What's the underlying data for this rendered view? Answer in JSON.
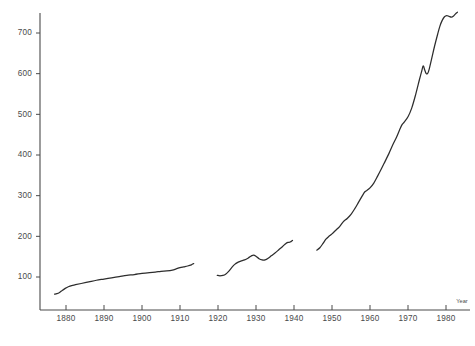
{
  "chart_data": {
    "type": "line",
    "title": "",
    "subtitle": "",
    "xlabel": "Year",
    "ylabel": "",
    "grid": false,
    "legend": "none",
    "xlim": [
      1872,
      1986
    ],
    "ylim": [
      0,
      775
    ],
    "x_ticks": [
      1880,
      1890,
      1900,
      1910,
      1920,
      1930,
      1940,
      1950,
      1960,
      1970,
      1980
    ],
    "x_tick_labels": [
      "1880",
      "1890",
      "1900",
      "1910",
      "1920",
      "1930",
      "1940",
      "1950",
      "1960",
      "1970",
      "1980"
    ],
    "y_ticks": [
      100,
      200,
      300,
      400,
      500,
      600,
      700
    ],
    "y_tick_labels": [
      "100",
      "200",
      "300",
      "400",
      "500",
      "600",
      "700"
    ],
    "line_color": "#2d2d2d",
    "axis_color": "#4a4a4a",
    "series": [
      {
        "name": "segment-1",
        "points": [
          [
            1877.0,
            58
          ],
          [
            1877.6,
            59
          ],
          [
            1878.3,
            62
          ],
          [
            1879.0,
            67
          ],
          [
            1879.8,
            72
          ],
          [
            1880.6,
            76
          ],
          [
            1881.5,
            79
          ],
          [
            1882.5,
            81
          ],
          [
            1884.0,
            84
          ],
          [
            1886.0,
            88
          ],
          [
            1888.0,
            92
          ],
          [
            1890.0,
            95
          ],
          [
            1892.0,
            98
          ],
          [
            1894.0,
            101
          ],
          [
            1896.0,
            104
          ],
          [
            1898.0,
            106
          ],
          [
            1900.0,
            109
          ],
          [
            1902.0,
            111
          ],
          [
            1903.5,
            112
          ],
          [
            1905.0,
            114
          ],
          [
            1906.5,
            115
          ],
          [
            1908.0,
            117
          ],
          [
            1909.0,
            120
          ],
          [
            1910.0,
            123
          ],
          [
            1911.0,
            125
          ],
          [
            1912.0,
            127
          ],
          [
            1913.0,
            130
          ],
          [
            1913.6,
            133
          ]
        ]
      },
      {
        "name": "segment-2",
        "points": [
          [
            1919.8,
            104
          ],
          [
            1920.5,
            103
          ],
          [
            1921.3,
            104
          ],
          [
            1922.0,
            107
          ],
          [
            1922.8,
            114
          ],
          [
            1923.6,
            123
          ],
          [
            1924.4,
            131
          ],
          [
            1925.2,
            136
          ],
          [
            1926.0,
            139
          ],
          [
            1927.0,
            142
          ],
          [
            1928.0,
            147
          ],
          [
            1928.8,
            152
          ],
          [
            1929.4,
            154
          ],
          [
            1930.0,
            151
          ],
          [
            1930.8,
            145
          ],
          [
            1931.6,
            142
          ],
          [
            1932.4,
            142
          ],
          [
            1933.2,
            146
          ],
          [
            1934.0,
            152
          ],
          [
            1935.0,
            159
          ],
          [
            1936.0,
            167
          ],
          [
            1937.0,
            175
          ],
          [
            1937.8,
            182
          ],
          [
            1938.4,
            185
          ],
          [
            1939.0,
            186
          ],
          [
            1939.6,
            190
          ]
        ]
      },
      {
        "name": "segment-3",
        "points": [
          [
            1946.0,
            166
          ],
          [
            1946.8,
            172
          ],
          [
            1947.6,
            182
          ],
          [
            1948.4,
            193
          ],
          [
            1949.2,
            200
          ],
          [
            1950.0,
            206
          ],
          [
            1951.0,
            215
          ],
          [
            1952.0,
            224
          ],
          [
            1953.0,
            236
          ],
          [
            1954.0,
            244
          ],
          [
            1955.0,
            254
          ],
          [
            1956.0,
            268
          ],
          [
            1957.0,
            284
          ],
          [
            1958.0,
            300
          ],
          [
            1958.6,
            309
          ],
          [
            1959.2,
            313
          ],
          [
            1960.0,
            319
          ],
          [
            1961.0,
            331
          ],
          [
            1962.0,
            348
          ],
          [
            1963.0,
            366
          ],
          [
            1964.0,
            385
          ],
          [
            1965.0,
            404
          ],
          [
            1966.0,
            425
          ],
          [
            1967.0,
            444
          ],
          [
            1967.8,
            462
          ],
          [
            1968.4,
            474
          ],
          [
            1969.0,
            481
          ],
          [
            1970.0,
            494
          ],
          [
            1971.0,
            516
          ],
          [
            1972.0,
            548
          ],
          [
            1973.0,
            585
          ],
          [
            1973.6,
            606
          ],
          [
            1974.0,
            619
          ],
          [
            1974.4,
            609
          ],
          [
            1974.8,
            600
          ],
          [
            1975.2,
            601
          ],
          [
            1975.6,
            612
          ],
          [
            1976.2,
            636
          ],
          [
            1977.0,
            668
          ],
          [
            1977.8,
            697
          ],
          [
            1978.4,
            717
          ],
          [
            1979.0,
            731
          ],
          [
            1979.6,
            740
          ],
          [
            1980.2,
            743
          ],
          [
            1980.8,
            741
          ],
          [
            1981.4,
            739
          ],
          [
            1982.0,
            742
          ],
          [
            1982.6,
            748
          ],
          [
            1983.0,
            751
          ]
        ]
      }
    ]
  }
}
